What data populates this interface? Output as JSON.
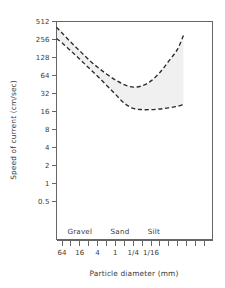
{
  "chart_data": {
    "type": "line",
    "title": "",
    "xlabel": "Particle diameter (mm)",
    "ylabel": "Speed of current (cm/sec)",
    "x_scale": "log2-descending",
    "y_scale": "log2",
    "ylim": [
      0.5,
      512
    ],
    "grid": false,
    "legend": null,
    "y_ticks": [
      "512",
      "256",
      "128",
      "64",
      "32",
      "16",
      "8",
      "4",
      "2",
      "1",
      "0.5"
    ],
    "y_tick_values": [
      512,
      256,
      128,
      64,
      32,
      16,
      8,
      4,
      2,
      1,
      0.5
    ],
    "x_ticks": [
      "64",
      "16",
      "4",
      "1",
      "1/4",
      "1/16"
    ],
    "x_tick_values": [
      64,
      16,
      4,
      1,
      0.25,
      0.0625
    ],
    "x_minor_tick_count": 17,
    "annotations": [
      {
        "text": "Gravel",
        "x_value": 16,
        "position": "inside-bottom"
      },
      {
        "text": "Sand",
        "x_value": 0.7,
        "position": "inside-bottom"
      },
      {
        "text": "Silt",
        "x_value": 0.05,
        "position": "inside-bottom"
      }
    ],
    "series": [
      {
        "name": "upper-curve",
        "style": "dashed",
        "points": [
          {
            "x": 100,
            "y": 410
          },
          {
            "x": 64,
            "y": 330
          },
          {
            "x": 32,
            "y": 230
          },
          {
            "x": 16,
            "y": 165
          },
          {
            "x": 8,
            "y": 118
          },
          {
            "x": 4,
            "y": 88
          },
          {
            "x": 2,
            "y": 68
          },
          {
            "x": 1,
            "y": 54
          },
          {
            "x": 0.5,
            "y": 45
          },
          {
            "x": 0.25,
            "y": 41
          },
          {
            "x": 0.125,
            "y": 43
          },
          {
            "x": 0.0625,
            "y": 52
          },
          {
            "x": 0.03125,
            "y": 72
          },
          {
            "x": 0.016,
            "y": 110
          },
          {
            "x": 0.008,
            "y": 175
          },
          {
            "x": 0.005,
            "y": 300
          }
        ]
      },
      {
        "name": "lower-curve",
        "style": "dashed",
        "points": [
          {
            "x": 100,
            "y": 265
          },
          {
            "x": 64,
            "y": 225
          },
          {
            "x": 32,
            "y": 165
          },
          {
            "x": 16,
            "y": 120
          },
          {
            "x": 8,
            "y": 86
          },
          {
            "x": 4,
            "y": 62
          },
          {
            "x": 2,
            "y": 44
          },
          {
            "x": 1,
            "y": 31
          },
          {
            "x": 0.5,
            "y": 22
          },
          {
            "x": 0.25,
            "y": 18
          },
          {
            "x": 0.125,
            "y": 17.2
          },
          {
            "x": 0.0625,
            "y": 17.2
          },
          {
            "x": 0.03125,
            "y": 17.6
          },
          {
            "x": 0.016,
            "y": 18.4
          },
          {
            "x": 0.008,
            "y": 19.5
          },
          {
            "x": 0.005,
            "y": 21
          }
        ]
      }
    ],
    "shaded_band": {
      "between": [
        "lower-curve",
        "upper-curve"
      ],
      "color": "#f0f0f0"
    }
  },
  "figure": {
    "ylabel": "Speed of current (cm/sec)",
    "xlabel": "Particle diameter (mm)",
    "y_tick_labels": [
      "512",
      "256",
      "128",
      "64",
      "32",
      "16",
      "8",
      "4",
      "2",
      "1",
      "0.5"
    ],
    "x_tick_labels": [
      "64",
      "16",
      "4",
      "1",
      "1/4",
      "1/16"
    ],
    "region_labels": [
      "Gravel",
      "Sand",
      "Silt"
    ],
    "colors": {
      "frame": "#666666",
      "curve": "#2b2b2b",
      "band": "#f0f0f0",
      "text": "#3a3a3a",
      "background": "#ffffff"
    }
  }
}
